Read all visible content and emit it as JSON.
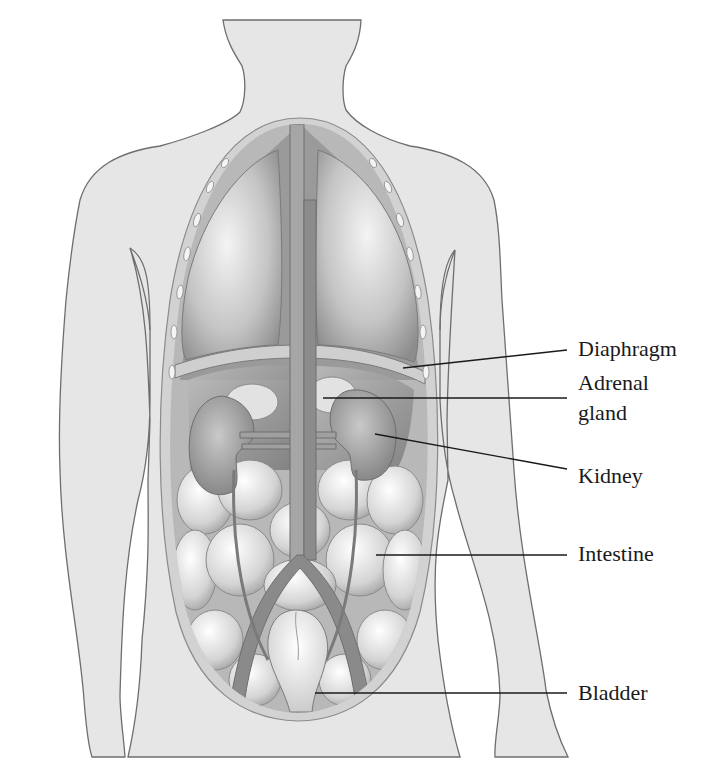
{
  "figure": {
    "colors": {
      "skin": "#e6e6e6",
      "outline": "#6e6e6e",
      "organ_dark": "#8a8a8a",
      "organ_mid": "#a8a8a8",
      "leader_line": "#1a1a1a",
      "text": "#1a1a1a"
    }
  },
  "labels": [
    {
      "id": "diaphragm",
      "text": "Diaphragm",
      "x": 578,
      "y": 336
    },
    {
      "id": "adrenal",
      "text": "Adrenal",
      "x": 578,
      "y": 370
    },
    {
      "id": "adrenal2",
      "text": "gland",
      "x": 578,
      "y": 400
    },
    {
      "id": "kidney",
      "text": "Kidney",
      "x": 578,
      "y": 463
    },
    {
      "id": "intestine",
      "text": "Intestine",
      "x": 578,
      "y": 541
    },
    {
      "id": "bladder",
      "text": "Bladder",
      "x": 578,
      "y": 680
    }
  ],
  "leaders": [
    {
      "id": "diaphragm",
      "x1": 403,
      "y1": 368,
      "x2": 567,
      "y2": 350
    },
    {
      "id": "adrenal",
      "x1": 323,
      "y1": 398,
      "x2": 567,
      "y2": 398
    },
    {
      "id": "kidney",
      "x1": 375,
      "y1": 434,
      "x2": 567,
      "y2": 469
    },
    {
      "id": "intestine",
      "x1": 376,
      "y1": 555,
      "x2": 567,
      "y2": 555
    },
    {
      "id": "bladder",
      "x1": 315,
      "y1": 693,
      "x2": 567,
      "y2": 693
    }
  ]
}
